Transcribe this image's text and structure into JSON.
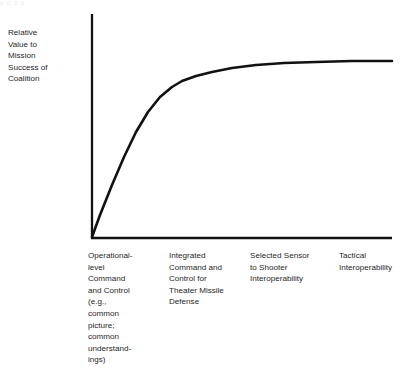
{
  "figure": {
    "name": "relative-value-vs-interoperability-curve",
    "background_color": "#ffffff",
    "ink_color": "#111111",
    "scan_remnant_text": "  y          g                                  p    y"
  },
  "y_axis_title": {
    "full_text": "Relative Value to Mission Success of Coalition",
    "lines": [
      "Relative",
      "Value to",
      "Mission",
      "Success of",
      "Coalition"
    ]
  },
  "x_labels": [
    {
      "full_text": "Operational-level Command and Control (e.g., common picture; common understandings)",
      "lines": [
        "Operational-",
        "level",
        "Command",
        "and Control",
        "(e.g.,",
        "common",
        "picture;",
        "common",
        "understand-",
        "ings)"
      ]
    },
    {
      "full_text": "Integrated Command and Control for Theater Missile Defense",
      "lines": [
        "Integrated",
        "Command and",
        "Control for",
        "Theater Missile",
        "Defense"
      ]
    },
    {
      "full_text": "Selected Sensor to Shooter Interoperability",
      "lines": [
        "Selected Sensor",
        "to Shooter",
        "Interoperability"
      ]
    },
    {
      "full_text": "Tactical Interoperability",
      "lines": [
        "Tactical",
        "Interoperability"
      ]
    }
  ],
  "chart_data": {
    "type": "line",
    "title": "",
    "xlabel": "",
    "ylabel": "Relative Value to Mission Success of Coalition",
    "grid": false,
    "legend": false,
    "axes": {
      "x_axis_line": {
        "x1": 92,
        "y1": 238,
        "x2": 392,
        "y2": 238
      },
      "y_axis_line": {
        "x1": 92,
        "y1": 14,
        "x2": 92,
        "y2": 238
      },
      "arrowheads": false,
      "ticks": false,
      "tick_labels": false
    },
    "categories": [
      "Operational-level Command and Control (e.g., common picture; common understandings)",
      "Integrated Command and Control for Theater Missile Defense",
      "Selected Sensor to Shooter Interoperability",
      "Tactical Interoperability"
    ],
    "category_x_positions": [
      100,
      185,
      278,
      365
    ],
    "series": [
      {
        "name": "Relative value curve",
        "line_color": "#111111",
        "line_width": 2.6,
        "description": "Steeply rising concave curve from origin that saturates (diminishing returns) toward a plateau at the right.",
        "points": [
          {
            "x": 92,
            "y": 237
          },
          {
            "x": 100,
            "y": 215
          },
          {
            "x": 112,
            "y": 185
          },
          {
            "x": 124,
            "y": 157
          },
          {
            "x": 136,
            "y": 132
          },
          {
            "x": 148,
            "y": 112
          },
          {
            "x": 160,
            "y": 97
          },
          {
            "x": 172,
            "y": 87
          },
          {
            "x": 182,
            "y": 81
          },
          {
            "x": 196,
            "y": 76
          },
          {
            "x": 212,
            "y": 72
          },
          {
            "x": 232,
            "y": 68
          },
          {
            "x": 256,
            "y": 65
          },
          {
            "x": 284,
            "y": 63
          },
          {
            "x": 316,
            "y": 62
          },
          {
            "x": 352,
            "y": 61
          },
          {
            "x": 392,
            "y": 61
          }
        ],
        "value_fractions": [
          0.0,
          0.1,
          0.23,
          0.36,
          0.47,
          0.56,
          0.63,
          0.67,
          0.7,
          0.72,
          0.74,
          0.76,
          0.77,
          0.78,
          0.79,
          0.79,
          0.79
        ]
      }
    ],
    "ylim": [
      0,
      1
    ],
    "xlim": [
      0,
      1
    ]
  }
}
